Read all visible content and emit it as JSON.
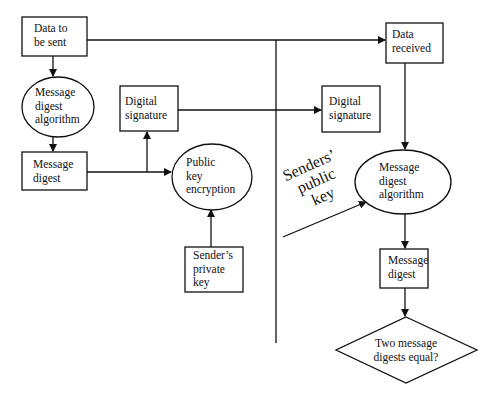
{
  "diagram": {
    "type": "digital-signature-flow",
    "divider": "vertical line separating sender (left) and receiver (right)",
    "sender": {
      "data_to_send": "Data to\nbe sent",
      "md_algorithm": "Message\ndigest\nalgorithm",
      "message_digest": "Message\ndigest",
      "digital_signature": "Digital\nsignature",
      "public_key_encryption": "Public\nkey\nencryption",
      "private_key": "Sender’s\nprivate\nkey"
    },
    "receiver": {
      "data_received": "Data\n received",
      "digital_signature": "Digital\nsignature",
      "public_key_label": "Senders’\npublic\nkey",
      "md_algorithm": "Message\ndigest\nalgorithm",
      "message_digest": "Message\ndigest",
      "decision": "Two message\ndigests equal?"
    },
    "edges": [
      {
        "from": "Data to be sent",
        "to": "Message digest algorithm (sender)"
      },
      {
        "from": "Message digest algorithm (sender)",
        "to": "Message digest (sender)"
      },
      {
        "from": "Message digest (sender)",
        "to": "Public key encryption"
      },
      {
        "from": "Message digest (sender)",
        "to": "Digital signature (sender)"
      },
      {
        "from": "Sender's private key",
        "to": "Public key encryption"
      },
      {
        "from": "Data to be sent",
        "to": "Data received"
      },
      {
        "from": "Digital signature (sender)",
        "to": "Digital signature (receiver)"
      },
      {
        "from": "Data received",
        "to": "Message digest algorithm (receiver)"
      },
      {
        "from": "Senders' public key",
        "to": "Message digest algorithm (receiver)"
      },
      {
        "from": "Message digest algorithm (receiver)",
        "to": "Message digest (receiver)"
      },
      {
        "from": "Message digest (receiver)",
        "to": "Two message digests equal?"
      }
    ]
  }
}
